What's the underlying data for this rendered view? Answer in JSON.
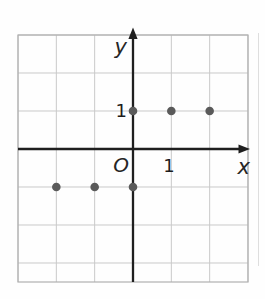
{
  "figure": {
    "labels": {
      "x_axis": "x",
      "y_axis": "y",
      "origin": "O",
      "x_tick": "1",
      "y_tick": "1"
    },
    "colors": {
      "background": "#fefefe",
      "grid_line": "#c9c9c9",
      "grid_frame": "#b0b0b0",
      "axis": "#1f1f1f",
      "point": "#5a5a5a",
      "label_text": "#262626",
      "photo_edge": "#dedede"
    }
  },
  "chart_data": {
    "type": "scatter",
    "points": [
      {
        "x": -2,
        "y": -1
      },
      {
        "x": -1,
        "y": -1
      },
      {
        "x": 0,
        "y": -1
      },
      {
        "x": 0,
        "y": 1
      },
      {
        "x": 1,
        "y": 1
      },
      {
        "x": 2,
        "y": 1
      }
    ],
    "title": "",
    "xlabel": "x",
    "ylabel": "y",
    "origin_label": "O",
    "x_tick_labels": [
      {
        "value": 1,
        "label": "1"
      }
    ],
    "y_tick_labels": [
      {
        "value": 1,
        "label": "1"
      }
    ],
    "xlim": [
      -3,
      3
    ],
    "ylim": [
      -3.5,
      3
    ],
    "grid": true,
    "legend": false,
    "axis_arrows": true
  }
}
